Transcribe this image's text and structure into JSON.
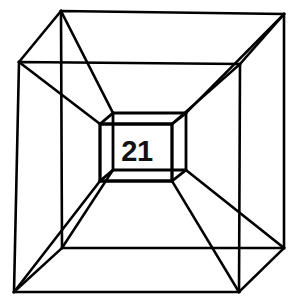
{
  "figure": {
    "name": "tesseract-diagram",
    "center_label": "21",
    "background_color": "#ffffff",
    "line_color": "#000000",
    "label_color": "#111111",
    "canvas": {
      "width": 291,
      "height": 303
    },
    "geometry": {
      "outer_front_square": {
        "name": "outer-front-square",
        "points": "19,62 240,64 239,292 14,292",
        "stroke_width": 2.6
      },
      "outer_back_square": {
        "name": "outer-back-square",
        "points": "61,11 284,14 284,248 62,248",
        "stroke_width": 2.6
      },
      "outer_connectors": {
        "name": "outer-connector-edges",
        "segments": [
          "19,62 61,11",
          "240,64 284,14",
          "239,292 284,248",
          "14,292 62,248"
        ],
        "stroke_width": 2.6
      },
      "inner_front_square": {
        "name": "inner-front-square",
        "points": "100,124 172,124 172,181 100,181",
        "stroke_width": 2.8
      },
      "inner_back_square": {
        "name": "inner-back-square",
        "points": "113,113 186,113 186,170 113,170",
        "stroke_width": 2.8
      },
      "inner_connectors": {
        "name": "inner-connector-edges",
        "segments": [
          "100,124 113,113",
          "172,124 186,113",
          "172,181 186,170",
          "100,181 113,170"
        ],
        "stroke_width": 2.8
      },
      "hyper_connectors_front": {
        "name": "hyper-connector-edges-front",
        "segments": [
          "19,62 100,124",
          "240,64 172,124",
          "239,292 172,181",
          "14,292 100,181"
        ],
        "stroke_width": 2.6
      },
      "hyper_connectors_back": {
        "name": "hyper-connector-edges-back",
        "segments": [
          "61,11 113,113",
          "284,14 186,113",
          "284,248 186,170",
          "62,248 113,170"
        ],
        "stroke_width": 2.6
      }
    }
  }
}
